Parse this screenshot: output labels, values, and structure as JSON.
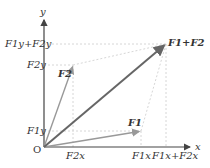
{
  "diagram": {
    "axes": {
      "x_label": "x",
      "y_label": "y",
      "origin_label": "O"
    },
    "vectors": [
      {
        "name": "F1",
        "label": "F1",
        "color": "#999999"
      },
      {
        "name": "F2",
        "label": "F2",
        "color": "#999999"
      },
      {
        "name": "sum",
        "label": "F1+F2",
        "color": "#666666"
      }
    ],
    "x_ticks": [
      "F2x",
      "F1x",
      "F1x+F2x"
    ],
    "y_ticks": [
      "F1y",
      "F2y",
      "F1y+F2y"
    ]
  }
}
